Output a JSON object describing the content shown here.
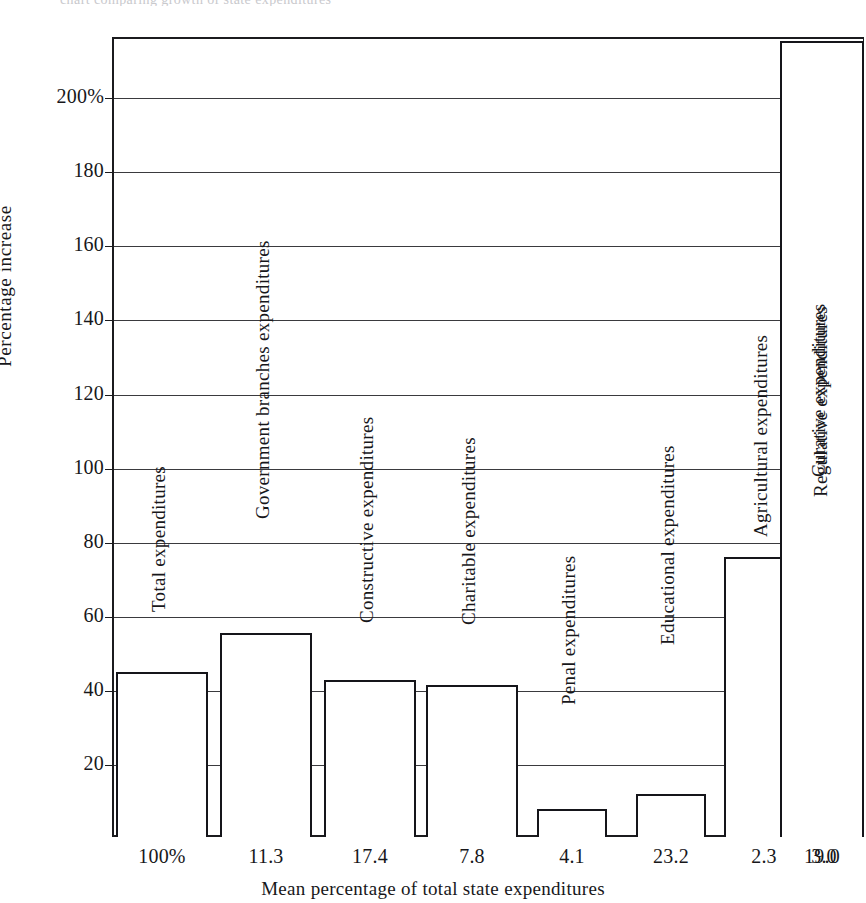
{
  "top_caption": "chart comparing growth of state expenditures",
  "chart_data": {
    "type": "bar",
    "title": "",
    "xlabel": "Mean percentage of total state expenditures",
    "ylabel": "Percentage  increase",
    "ylim": [
      0,
      216
    ],
    "grid": true,
    "legend": "none",
    "y_ticks": [
      {
        "value": 200,
        "label": "200%"
      },
      {
        "value": 180,
        "label": "180"
      },
      {
        "value": 160,
        "label": "160"
      },
      {
        "value": 140,
        "label": "140"
      },
      {
        "value": 120,
        "label": "120"
      },
      {
        "value": 100,
        "label": "100"
      },
      {
        "value": 80,
        "label": "80"
      },
      {
        "value": 60,
        "label": "60"
      },
      {
        "value": 40,
        "label": "40"
      },
      {
        "value": 20,
        "label": "20"
      }
    ],
    "categories": [
      "100%",
      "11.3",
      "17.4",
      "7.8",
      "4.1",
      "23.2",
      "2.3",
      "3.0",
      "19.0"
    ],
    "values": [
      44.5,
      55,
      42.5,
      41,
      7.5,
      11.5,
      75.5,
      99.5,
      216
    ],
    "bar_labels": [
      "Total expenditures",
      "Government branches expenditures",
      "Constructive expenditures",
      "Charitable expenditures",
      "Penal expenditures",
      "Educational expenditures",
      "Agricultural expenditures",
      "Regulative expenditures",
      "Curative expenditures"
    ],
    "bar_geometry": [
      {
        "x": 4,
        "w": 92
      },
      {
        "x": 108,
        "w": 92
      },
      {
        "x": 212,
        "w": 92
      },
      {
        "x": 314,
        "w": 92
      },
      {
        "x": 425,
        "w": 70
      },
      {
        "x": 524,
        "w": 70
      },
      {
        "x": 612,
        "w": 80
      },
      {
        "x": 690,
        "w": 44
      },
      {
        "x": 668,
        "w": 84
      }
    ],
    "bar_label_offsets": [
      225,
      318,
      214,
      212,
      132,
      192,
      300,
      340,
      360
    ]
  },
  "colors": {
    "ink": "#15151a",
    "grid": "#3a3a3e",
    "background": "#ffffff"
  }
}
